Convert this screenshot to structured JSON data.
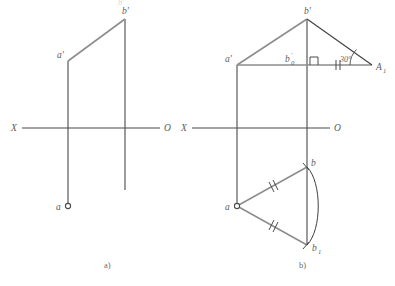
{
  "figure": {
    "background_color": "#ffffff",
    "axis_color": "#4a4a4a",
    "construction_color": "#8d8d8d",
    "label_color": "#5b5b5b",
    "arc_color": "#3f3f3f",
    "top_cut_text": "b'",
    "panels": [
      {
        "id": "a",
        "caption": "a)",
        "caption_x": 104,
        "caption_y": 268,
        "ground_line": {
          "label_left": "X",
          "label_right": "O",
          "x1": 22,
          "x2": 160,
          "y": 128,
          "label_left_x": 11,
          "label_left_y": 131,
          "label_right_x": 164,
          "label_right_y": 131
        },
        "points": [
          {
            "name": "a'",
            "x": 68,
            "y": 61,
            "label_dx": -11,
            "label_dy": -3,
            "marker": "none"
          },
          {
            "name": "b'",
            "x": 125,
            "y": 19,
            "label_dx": -3,
            "label_dy": -5,
            "marker": "none"
          },
          {
            "name": "a",
            "x": 68,
            "y": 206,
            "label_dx": -12,
            "label_dy": 4,
            "marker": "circle"
          }
        ],
        "segments": [
          {
            "from": "a'",
            "to": "b'",
            "kind": "construction"
          }
        ],
        "verticals": [
          {
            "x": 68,
            "y1": 61,
            "y2": 206,
            "kind": "axis"
          },
          {
            "x": 125,
            "y1": 19,
            "y2": 190,
            "kind": "axis"
          }
        ]
      },
      {
        "id": "b",
        "caption": "b)",
        "caption_x": 299,
        "caption_y": 268,
        "ground_line": {
          "label_left": "X",
          "label_right": "O",
          "x1": 192,
          "x2": 330,
          "y": 128,
          "label_left_x": 181,
          "label_left_y": 131,
          "label_right_x": 334,
          "label_right_y": 131
        },
        "points": [
          {
            "name": "a'",
            "x": 237,
            "y": 65,
            "label_dx": -12,
            "label_dy": -2,
            "marker": "none"
          },
          {
            "name": "b'",
            "x": 307,
            "y": 19,
            "label_dx": -3,
            "label_dy": -5,
            "marker": "none"
          },
          {
            "name": "b'0",
            "label_text": "b",
            "label_sub": "0",
            "label_prime": "'",
            "x": 307,
            "y": 65,
            "label_dx": -22,
            "label_dy": -3,
            "marker": "none"
          },
          {
            "name": "A1",
            "label_text": "A",
            "label_sub": "1",
            "x": 372,
            "y": 65,
            "label_dx": 4,
            "label_dy": 4,
            "marker": "none"
          },
          {
            "name": "a",
            "x": 237,
            "y": 206,
            "label_dx": -12,
            "label_dy": 4,
            "marker": "circle"
          },
          {
            "name": "b",
            "x": 307,
            "y": 167,
            "label_dx": 4,
            "label_dy": -1,
            "marker": "none"
          },
          {
            "name": "b1",
            "label_text": "b",
            "label_sub": "1",
            "x": 307,
            "y": 245,
            "label_dx": 5,
            "label_dy": 6,
            "marker": "none"
          }
        ],
        "segments": [
          {
            "from": "a'",
            "to": "b'",
            "kind": "construction"
          },
          {
            "from": "a'",
            "to": "A1",
            "kind": "construction"
          },
          {
            "from": "b'",
            "to": "A1",
            "kind": "axis"
          },
          {
            "from": "a",
            "to": "b",
            "kind": "construction",
            "ticks": 2
          },
          {
            "from": "a",
            "to": "b1",
            "kind": "construction",
            "ticks": 2
          }
        ],
        "verticals": [
          {
            "x": 237,
            "y1": 65,
            "y2": 206,
            "kind": "axis"
          },
          {
            "x": 307,
            "y1": 19,
            "y2": 245,
            "kind": "axis"
          }
        ],
        "angle": {
          "value": "30°",
          "vertex": "A1",
          "label_x": 342,
          "label_y": 62,
          "arc_radius": 22
        },
        "right_angle_marker": {
          "x": 307,
          "y": 65,
          "size": 8,
          "direction": "up-right"
        },
        "equal_ticks_on_base": {
          "x": 338,
          "y": 65,
          "count": 2
        },
        "arc": {
          "from": "b",
          "to": "b1",
          "center": "a",
          "description": "rotation arc from b to b1"
        }
      }
    ]
  }
}
